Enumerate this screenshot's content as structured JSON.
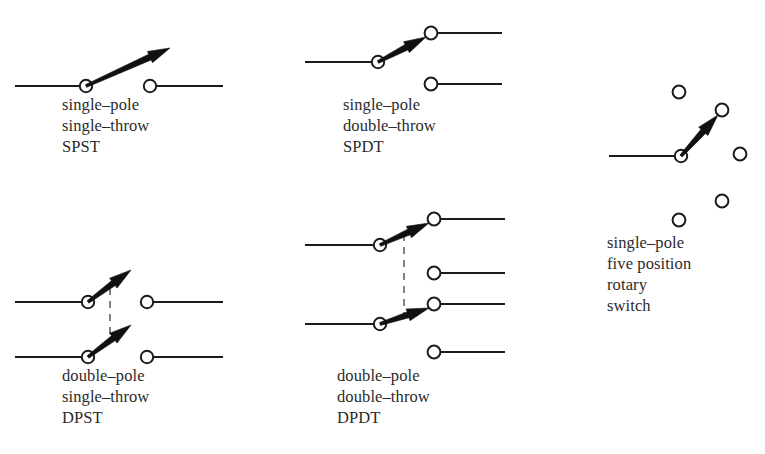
{
  "page": {
    "background_color": "#ffffff",
    "ink_color": "#1c1c1c",
    "gang_color": "#5b5b5b",
    "width": 765,
    "height": 454
  },
  "symbols": [
    {
      "id": "spst",
      "name": "single-pole-single-throw-switch",
      "caption_lines": [
        "single–pole",
        "single–throw",
        "SPST"
      ],
      "caption_x": 62,
      "caption_y": 110,
      "caption_line_height": 21,
      "wires": [
        {
          "name": "input-wire",
          "x1": 15,
          "y1": 86,
          "x2": 86,
          "y2": 86
        },
        {
          "name": "output-wire",
          "x1": 150,
          "y1": 86,
          "x2": 223,
          "y2": 86
        }
      ],
      "terminals": [
        {
          "name": "pivot-terminal",
          "cx": 86,
          "cy": 86,
          "r": 6.2
        },
        {
          "name": "output-terminal",
          "cx": 150,
          "cy": 86,
          "r": 6.2
        }
      ],
      "blades": [
        {
          "name": "switch-blade",
          "x1": 86,
          "y1": 86,
          "x2": 170,
          "y2": 48
        }
      ],
      "gang_lines": []
    },
    {
      "id": "spdt",
      "name": "single-pole-double-throw-switch",
      "caption_lines": [
        "single–pole",
        "double–throw",
        "SPDT"
      ],
      "caption_x": 343,
      "caption_y": 110,
      "caption_line_height": 21,
      "wires": [
        {
          "name": "input-wire",
          "x1": 305,
          "y1": 62,
          "x2": 378,
          "y2": 62
        },
        {
          "name": "upper-output-wire",
          "x1": 438,
          "y1": 33,
          "x2": 502,
          "y2": 33
        },
        {
          "name": "lower-output-wire",
          "x1": 438,
          "y1": 84,
          "x2": 502,
          "y2": 84
        }
      ],
      "terminals": [
        {
          "name": "pivot-terminal",
          "cx": 378,
          "cy": 62,
          "r": 6.2
        },
        {
          "name": "upper-output-terminal",
          "cx": 431,
          "cy": 33,
          "r": 6.4
        },
        {
          "name": "lower-output-terminal",
          "cx": 431,
          "cy": 84,
          "r": 6.4
        }
      ],
      "blades": [
        {
          "name": "switch-blade",
          "x1": 378,
          "y1": 62,
          "x2": 426,
          "y2": 37
        }
      ],
      "gang_lines": []
    },
    {
      "id": "rotary",
      "name": "single-pole-five-position-rotary-switch",
      "caption_lines": [
        "single–pole",
        "five position",
        "rotary",
        "switch"
      ],
      "caption_x": 607,
      "caption_y": 248,
      "caption_line_height": 21,
      "wires": [
        {
          "name": "input-wire",
          "x1": 609,
          "y1": 156,
          "x2": 681,
          "y2": 156
        }
      ],
      "terminals": [
        {
          "name": "pivot-terminal",
          "cx": 681,
          "cy": 156,
          "r": 6.2
        },
        {
          "name": "position-1-terminal",
          "cx": 679,
          "cy": 92,
          "r": 6.4
        },
        {
          "name": "position-2-terminal",
          "cx": 722,
          "cy": 110,
          "r": 6.4
        },
        {
          "name": "position-3-terminal",
          "cx": 740,
          "cy": 154,
          "r": 6.4
        },
        {
          "name": "position-4-terminal",
          "cx": 722,
          "cy": 201,
          "r": 6.4
        },
        {
          "name": "position-5-terminal",
          "cx": 679,
          "cy": 220,
          "r": 6.4
        }
      ],
      "blades": [
        {
          "name": "rotor-blade",
          "x1": 681,
          "y1": 156,
          "x2": 718,
          "y2": 115
        }
      ],
      "gang_lines": []
    },
    {
      "id": "dpst",
      "name": "double-pole-single-throw-switch",
      "caption_lines": [
        "double–pole",
        "single–throw",
        "DPST"
      ],
      "caption_x": 62,
      "caption_y": 381,
      "caption_line_height": 21,
      "wires": [
        {
          "name": "upper-input-wire",
          "x1": 15,
          "y1": 302,
          "x2": 88,
          "y2": 302
        },
        {
          "name": "upper-output-wire",
          "x1": 152,
          "y1": 302,
          "x2": 223,
          "y2": 302
        },
        {
          "name": "lower-input-wire",
          "x1": 15,
          "y1": 357,
          "x2": 88,
          "y2": 357
        },
        {
          "name": "lower-output-wire",
          "x1": 152,
          "y1": 357,
          "x2": 223,
          "y2": 357
        }
      ],
      "terminals": [
        {
          "name": "upper-pivot-terminal",
          "cx": 88,
          "cy": 302,
          "r": 6.2
        },
        {
          "name": "upper-output-terminal",
          "cx": 147,
          "cy": 302,
          "r": 6.2
        },
        {
          "name": "lower-pivot-terminal",
          "cx": 88,
          "cy": 357,
          "r": 6.2
        },
        {
          "name": "lower-output-terminal",
          "cx": 147,
          "cy": 357,
          "r": 6.2
        }
      ],
      "blades": [
        {
          "name": "upper-switch-blade",
          "x1": 88,
          "y1": 302,
          "x2": 131,
          "y2": 270
        },
        {
          "name": "lower-switch-blade",
          "x1": 88,
          "y1": 357,
          "x2": 131,
          "y2": 325
        }
      ],
      "gang_lines": [
        {
          "name": "ganging-link",
          "x1": 110,
          "y1": 288,
          "x2": 110,
          "y2": 343
        }
      ]
    },
    {
      "id": "dpdt",
      "name": "double-pole-double-throw-switch",
      "caption_lines": [
        "double–pole",
        "double–throw",
        "DPDT"
      ],
      "caption_x": 337,
      "caption_y": 381,
      "caption_line_height": 21,
      "wires": [
        {
          "name": "upper-input-wire",
          "x1": 305,
          "y1": 245,
          "x2": 380,
          "y2": 245
        },
        {
          "name": "lower-input-wire",
          "x1": 305,
          "y1": 324,
          "x2": 380,
          "y2": 324
        },
        {
          "name": "output-wire-1",
          "x1": 441,
          "y1": 219,
          "x2": 505,
          "y2": 219
        },
        {
          "name": "output-wire-2",
          "x1": 441,
          "y1": 273,
          "x2": 505,
          "y2": 273
        },
        {
          "name": "output-wire-3",
          "x1": 441,
          "y1": 304,
          "x2": 505,
          "y2": 304
        },
        {
          "name": "output-wire-4",
          "x1": 441,
          "y1": 352,
          "x2": 505,
          "y2": 352
        }
      ],
      "terminals": [
        {
          "name": "upper-pivot-terminal",
          "cx": 380,
          "cy": 245,
          "r": 6.2
        },
        {
          "name": "lower-pivot-terminal",
          "cx": 380,
          "cy": 324,
          "r": 6.2
        },
        {
          "name": "output-terminal-1",
          "cx": 434,
          "cy": 219,
          "r": 6.4
        },
        {
          "name": "output-terminal-2",
          "cx": 434,
          "cy": 273,
          "r": 6.4
        },
        {
          "name": "output-terminal-3",
          "cx": 434,
          "cy": 304,
          "r": 6.4
        },
        {
          "name": "output-terminal-4",
          "cx": 434,
          "cy": 352,
          "r": 6.4
        }
      ],
      "blades": [
        {
          "name": "upper-switch-blade",
          "x1": 380,
          "y1": 245,
          "x2": 429,
          "y2": 223
        },
        {
          "name": "lower-switch-blade",
          "x1": 380,
          "y1": 324,
          "x2": 429,
          "y2": 308
        }
      ],
      "gang_lines": [
        {
          "name": "ganging-link",
          "x1": 404,
          "y1": 234,
          "x2": 404,
          "y2": 318
        }
      ]
    }
  ]
}
